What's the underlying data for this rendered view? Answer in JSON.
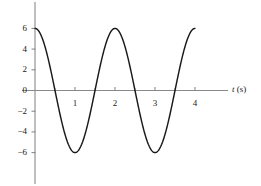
{
  "chart_data": {
    "type": "line",
    "title": "",
    "xlabel": "t (s)",
    "ylabel": "",
    "xlim": [
      -0.07,
      4.6
    ],
    "ylim": [
      -7.6,
      7.6
    ],
    "grid": false,
    "legend": null,
    "function": "y = 6 cos(pi t)",
    "amplitude": 6,
    "period": 2,
    "phase": 0,
    "xticks": [
      1,
      2,
      3,
      4
    ],
    "xtick_labels": [
      "1",
      "2",
      "3",
      "4"
    ],
    "xminor_ticks": [
      0.5,
      1.5,
      2.5,
      3.5
    ],
    "yticks": [
      6,
      4,
      2,
      0,
      -2,
      -4,
      -6
    ],
    "ytick_labels": [
      "6",
      "4",
      "2",
      "0",
      "−2",
      "−4",
      "−6"
    ],
    "x": [
      0,
      0.1,
      0.2,
      0.3,
      0.4,
      0.5,
      0.6,
      0.7,
      0.8,
      0.9,
      1.0,
      1.1,
      1.2,
      1.3,
      1.4,
      1.5,
      1.6,
      1.7,
      1.8,
      1.9,
      2.0,
      2.1,
      2.2,
      2.3,
      2.4,
      2.5,
      2.6,
      2.7,
      2.8,
      2.9,
      3.0,
      3.1,
      3.2,
      3.3,
      3.4,
      3.5,
      3.6,
      3.7,
      3.8,
      3.9,
      4.0
    ],
    "y": [
      6.0,
      5.71,
      4.85,
      3.53,
      1.85,
      0.0,
      -1.85,
      -3.53,
      -4.85,
      -5.71,
      -6.0,
      -5.71,
      -4.85,
      -3.53,
      -1.85,
      0.0,
      1.85,
      3.53,
      4.85,
      5.71,
      6.0,
      5.71,
      4.85,
      3.53,
      1.85,
      0.0,
      -1.85,
      -3.53,
      -4.85,
      -5.71,
      -6.0,
      -5.71,
      -4.85,
      -3.53,
      -1.85,
      0.0,
      1.85,
      3.53,
      4.85,
      5.71,
      6.0
    ],
    "zero_crossings": [
      0.5,
      1.5,
      2.5,
      3.5
    ],
    "maxima_t": [
      0,
      2,
      4
    ],
    "minima_t": [
      1,
      3
    ],
    "curve_color": "#1a1a1a",
    "axis_color": "#8a8a8a"
  },
  "axis_label_x": {
    "symbol": "t",
    "unit": " (s)"
  },
  "icons": {
    "curve": "sine-curve",
    "axes": "cartesian-axes"
  }
}
